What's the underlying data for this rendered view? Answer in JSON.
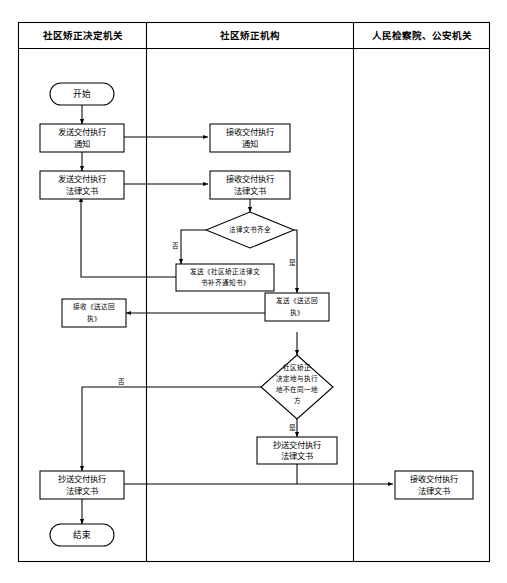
{
  "diagram": {
    "type": "swimlane-flowchart",
    "lanes": [
      {
        "id": "lane-decision-org",
        "label": "社区矫正决定机关"
      },
      {
        "id": "lane-correction-org",
        "label": "社区矫正机构"
      },
      {
        "id": "lane-procuratorate-police",
        "label": "人民检察院、公安机关"
      }
    ],
    "nodes": [
      {
        "id": "start",
        "lane": 0,
        "shape": "terminal",
        "label": "开始"
      },
      {
        "id": "send-notice",
        "lane": 0,
        "shape": "process",
        "label": "发送交付执行通知",
        "line1": "发送交付执行",
        "line2": "通知"
      },
      {
        "id": "send-documents",
        "lane": 0,
        "shape": "process",
        "label": "发送交付执行法律文书",
        "line1": "发送交付执行",
        "line2": "法律文书"
      },
      {
        "id": "receive-notice",
        "lane": 1,
        "shape": "process",
        "label": "接收交付执行通知",
        "line1": "接收交付执行",
        "line2": "通知"
      },
      {
        "id": "receive-documents",
        "lane": 1,
        "shape": "process",
        "label": "接收交付执行法律文书",
        "line1": "接收交付执行",
        "line2": "法律文书"
      },
      {
        "id": "check-documents",
        "lane": 1,
        "shape": "decision",
        "label": "法律文书齐全"
      },
      {
        "id": "send-supplement",
        "lane": 1,
        "shape": "process",
        "label": "发送《社区矫正法律文书补齐通知书》",
        "line1": "发送《社区矫正法律文",
        "line2": "书补齐通知书》"
      },
      {
        "id": "send-receipt",
        "lane": 1,
        "shape": "process",
        "label": "发送《送达回执》",
        "line1": "发送《送达回",
        "line2": "执》"
      },
      {
        "id": "receive-receipt",
        "lane": 0,
        "shape": "process",
        "label": "接收《送达回执》",
        "line1": "接收《送达回",
        "line2": "执》"
      },
      {
        "id": "check-location",
        "lane": 1,
        "shape": "decision",
        "label": "社区矫正决定地与执行地不在同一地方",
        "line1": "社区矫正",
        "line2": "决定地与执行",
        "line3": "地不在同一地",
        "line4": "方"
      },
      {
        "id": "cc-documents-mid",
        "lane": 1,
        "shape": "process",
        "label": "抄送交付执行法律文书",
        "line1": "抄送交付执行",
        "line2": "法律文书"
      },
      {
        "id": "cc-documents-left",
        "lane": 0,
        "shape": "process",
        "label": "抄送交付执行法律文书",
        "line1": "抄送交付执行",
        "line2": "法律文书"
      },
      {
        "id": "receive-cc-documents",
        "lane": 2,
        "shape": "process",
        "label": "接收交付执行法律文书",
        "line1": "接收交付执行",
        "line2": "法律文书"
      },
      {
        "id": "end",
        "lane": 0,
        "shape": "terminal",
        "label": "结束"
      }
    ],
    "branch_labels": {
      "documents_no": "否",
      "documents_yes": "是",
      "location_no": "否",
      "location_yes": "是"
    },
    "edges": [
      {
        "from": "start",
        "to": "send-notice",
        "label": ""
      },
      {
        "from": "send-notice",
        "to": "receive-notice",
        "label": ""
      },
      {
        "from": "send-notice",
        "to": "send-documents",
        "label": ""
      },
      {
        "from": "send-documents",
        "to": "receive-documents",
        "label": ""
      },
      {
        "from": "receive-documents",
        "to": "check-documents",
        "label": ""
      },
      {
        "from": "check-documents",
        "to": "send-supplement",
        "label": "否"
      },
      {
        "from": "check-documents",
        "to": "send-receipt",
        "label": "是"
      },
      {
        "from": "send-supplement",
        "to": "send-documents",
        "label": ""
      },
      {
        "from": "send-receipt",
        "to": "receive-receipt",
        "label": ""
      },
      {
        "from": "send-receipt",
        "to": "check-location",
        "label": ""
      },
      {
        "from": "check-location",
        "to": "cc-documents-mid",
        "label": "是"
      },
      {
        "from": "check-location",
        "to": "cc-documents-left",
        "label": "否"
      },
      {
        "from": "cc-documents-mid",
        "to": "cc-documents-left",
        "label": ""
      },
      {
        "from": "cc-documents-left",
        "to": "receive-cc-documents",
        "label": ""
      },
      {
        "from": "cc-documents-left",
        "to": "end",
        "label": ""
      }
    ],
    "colors": {
      "background": "#ffffff",
      "stroke": "#000000",
      "text": "#000000",
      "node_fill": "#ffffff"
    }
  }
}
